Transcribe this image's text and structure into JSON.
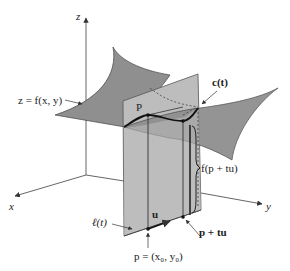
{
  "figure": {
    "colors": {
      "surface": "#8f8f8f",
      "plane": "#bdbdbd",
      "plane_edge": "#555555",
      "curve": "#111111",
      "axis": "#555555",
      "background": "#ffffff"
    },
    "axes": {
      "x_label": "x",
      "y_label": "y",
      "z_label": "z"
    },
    "labels": {
      "surface": "z = f(x, y)",
      "point_P": "P",
      "curve": "c(t)",
      "height": "f(p + tu)",
      "line": "ℓ(t)",
      "direction": "u",
      "base_point": "p = (x₀, y₀)",
      "moved_point": "p + tu"
    }
  }
}
